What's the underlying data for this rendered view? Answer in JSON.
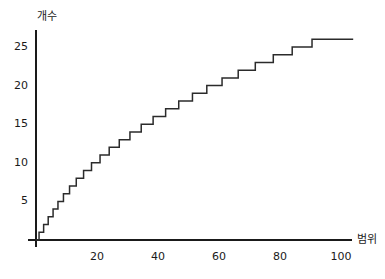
{
  "chart_data": {
    "type": "line",
    "subtype": "step-ogive",
    "title": "",
    "subtitle": "",
    "xlabel": "범위",
    "ylabel": "개수",
    "xlim": [
      0,
      105
    ],
    "ylim": [
      0,
      27
    ],
    "grid": false,
    "legend": null,
    "legend_position": "none",
    "x_ticks": [
      20,
      40,
      60,
      80,
      100
    ],
    "x_tick_labels": [
      "20",
      "40",
      "60",
      "80",
      "100"
    ],
    "y_ticks": [
      5,
      10,
      15,
      20,
      25
    ],
    "y_tick_labels": [
      "5",
      "10",
      "15",
      "20",
      "25"
    ],
    "series": [
      {
        "name": "cumulative-count",
        "color": "#2b2b2b",
        "step_mode": "post",
        "x": [
          0,
          1.0,
          2.5,
          4.0,
          5.6,
          7.2,
          9.0,
          11.0,
          13.2,
          15.6,
          18.2,
          21.0,
          24.0,
          27.3,
          30.8,
          34.5,
          38.4,
          42.5,
          46.8,
          51.3,
          56.0,
          61.0,
          66.3,
          71.9,
          77.8,
          84.0,
          90.5,
          97.3,
          104.0
        ],
        "y": [
          0,
          1,
          2,
          3,
          4,
          5,
          6,
          7,
          8,
          9,
          10,
          11,
          12,
          13,
          14,
          15,
          16,
          17,
          18,
          19,
          20,
          21,
          22,
          23,
          24,
          25,
          26,
          26,
          26
        ]
      }
    ]
  },
  "axes": {
    "y_axis_name": "y-axis",
    "x_axis_name": "x-axis"
  },
  "colors": {
    "line": "#2b2b2b",
    "axis": "#1a1a1a",
    "background": "#ffffff"
  }
}
